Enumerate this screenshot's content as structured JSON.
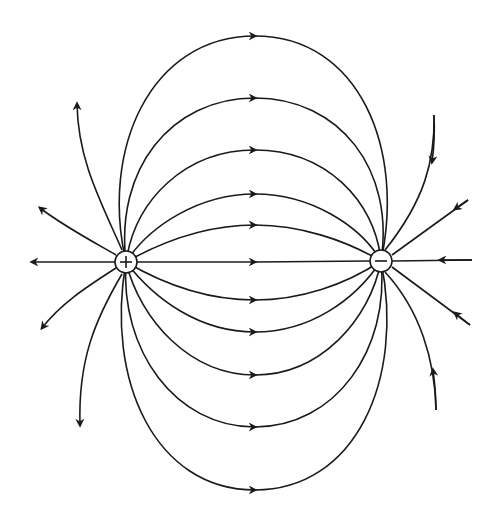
{
  "diagram": {
    "title": "Electric field lines of an electric dipole",
    "type": "field-lines",
    "charges": [
      {
        "name": "positive-charge",
        "sign": "+",
        "x": 126,
        "y": 262,
        "r": 11
      },
      {
        "name": "negative-charge",
        "sign": "−",
        "x": 381,
        "y": 261,
        "r": 11
      }
    ],
    "line_color": "#1a1a1a",
    "background": "#ffffff",
    "connecting_lines_count": 11,
    "outgoing_lines_left_count": 5,
    "incoming_lines_right_count": 5,
    "arrow_direction": "from positive to negative"
  }
}
